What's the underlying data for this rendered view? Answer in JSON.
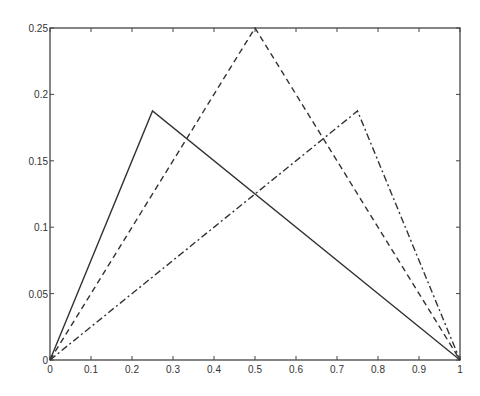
{
  "chart_data": {
    "type": "line",
    "title": "",
    "xlabel": "",
    "ylabel": "",
    "xlim": [
      0,
      1
    ],
    "ylim": [
      0,
      0.25
    ],
    "grid": false,
    "legend": null,
    "x_ticks": [
      "0",
      "0.1",
      "0.2",
      "0.3",
      "0.4",
      "0.5",
      "0.6",
      "0.7",
      "0.8",
      "0.9",
      "1"
    ],
    "y_ticks": [
      "0",
      "0.05",
      "0.1",
      "0.15",
      "0.2",
      "0.25"
    ],
    "series": [
      {
        "name": "solid",
        "style": "solid",
        "x": [
          0,
          0.25,
          1
        ],
        "y": [
          0,
          0.1875,
          0
        ]
      },
      {
        "name": "dashed",
        "style": "dashed",
        "x": [
          0,
          0.5,
          1
        ],
        "y": [
          0,
          0.25,
          0
        ]
      },
      {
        "name": "dash-dot",
        "style": "dashdot",
        "x": [
          0,
          0.75,
          1
        ],
        "y": [
          0,
          0.1875,
          0
        ]
      }
    ]
  },
  "colors": {
    "line": "#333333",
    "axes": "#444444"
  }
}
